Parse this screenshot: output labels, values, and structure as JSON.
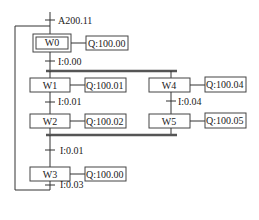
{
  "diagram": {
    "type": "SFC / GRAFCET",
    "initial_transition": "A200.11",
    "steps": [
      {
        "id": "W0",
        "action": "Q:100.00",
        "initial": true
      },
      {
        "id": "W1",
        "action": "Q:100.01"
      },
      {
        "id": "W2",
        "action": "Q:100.02"
      },
      {
        "id": "W4",
        "action": "Q:100.04"
      },
      {
        "id": "W5",
        "action": "Q:100.05"
      },
      {
        "id": "W3",
        "action": "Q:100.00"
      }
    ],
    "transitions": {
      "t0": "I:0.00",
      "t1": "I:0.01",
      "t4": "I:0.04",
      "t2": "I:0.01",
      "t3": "I:0.03"
    }
  },
  "colors": {
    "line": "#333333",
    "bar": "#555555",
    "text": "#222222"
  }
}
